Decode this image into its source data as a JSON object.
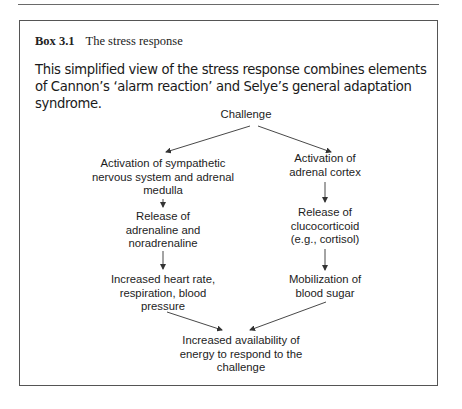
{
  "box": {
    "number": "Box 3.1",
    "title": "The stress response",
    "intro": "This simplified view of the stress response combines elements of Cannon’s ‘alarm reaction’ and Selye’s general adaptation syndrome."
  },
  "diagram": {
    "root": {
      "lines": [
        "Challenge"
      ]
    },
    "left": [
      {
        "lines": [
          "Activation of sympathetic",
          "nervous system and adrenal",
          "medulla"
        ]
      },
      {
        "lines": [
          "Release of",
          "adrenaline and",
          "noradrenaline"
        ]
      },
      {
        "lines": [
          "Increased heart rate,",
          "respiration, blood",
          "pressure"
        ]
      }
    ],
    "right": [
      {
        "lines": [
          "Activation of",
          "adrenal cortex"
        ]
      },
      {
        "lines": [
          "Release of",
          "clucocorticoid",
          "(e.g., cortisol)"
        ]
      },
      {
        "lines": [
          "Mobilization of",
          "blood sugar"
        ]
      }
    ],
    "outcome": {
      "lines": [
        "Increased availability of",
        "energy to respond to the",
        "challenge"
      ]
    }
  },
  "colors": {
    "line": "#333333",
    "text": "#1a1a1a",
    "border": "#555555"
  }
}
